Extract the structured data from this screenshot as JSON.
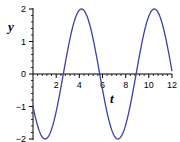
{
  "chart_data": {
    "type": "line",
    "title": "",
    "xlabel": "t",
    "ylabel": "y",
    "xlim": [
      0,
      12
    ],
    "ylim": [
      -2,
      2
    ],
    "x_ticks": [
      2,
      4,
      6,
      8,
      10,
      12
    ],
    "y_ticks": [
      -2,
      -1,
      0,
      1,
      2
    ],
    "x_tick_labels": [
      "2",
      "4",
      "6",
      "8",
      "10",
      "12"
    ],
    "y_tick_labels": [
      "−2",
      "−1",
      "0",
      "1",
      "2"
    ],
    "grid": false,
    "legend": null,
    "series": [
      {
        "name": "y(t)",
        "color": "#3b3fa8",
        "expression": "y = -2 sin(t + π/6)",
        "x": [
          0,
          0.5,
          1.05,
          1.5,
          2,
          2.62,
          3,
          3.5,
          4.19,
          4.5,
          5,
          5.76,
          6,
          6.5,
          7.33,
          7.5,
          8,
          8.9,
          9.5,
          10,
          10.47,
          11,
          11.5,
          12
        ],
        "values": [
          -1,
          -1.76,
          -2,
          -1.95,
          -1.56,
          0,
          0.73,
          1.61,
          2,
          1.93,
          1.46,
          0,
          -0.48,
          -1.37,
          -2,
          -1.99,
          -1.8,
          0,
          1.14,
          1.72,
          2,
          1.73,
          1.09,
          0.09
        ]
      }
    ]
  },
  "labels": {
    "y_axis": "y",
    "x_axis": "t",
    "y_ticks": {
      "p2": "2",
      "p1": "1",
      "z": "0",
      "m1": "−1",
      "m2": "−2"
    },
    "x_ticks": {
      "t2": "2",
      "t4": "4",
      "t6": "6",
      "t8": "8",
      "t10": "10",
      "t12": "12"
    }
  }
}
